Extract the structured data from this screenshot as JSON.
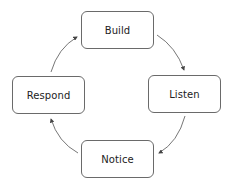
{
  "diagram": {
    "type": "cycle",
    "nodes": [
      {
        "id": "build",
        "label": "Build"
      },
      {
        "id": "listen",
        "label": "Listen"
      },
      {
        "id": "notice",
        "label": "Notice"
      },
      {
        "id": "respond",
        "label": "Respond"
      }
    ],
    "edges": [
      {
        "from": "build",
        "to": "listen"
      },
      {
        "from": "listen",
        "to": "notice"
      },
      {
        "from": "notice",
        "to": "respond"
      },
      {
        "from": "respond",
        "to": "build"
      }
    ],
    "colors": {
      "stroke": "#6a6a6a",
      "text": "#222222",
      "arrow": "#555555",
      "background": "#ffffff"
    }
  }
}
